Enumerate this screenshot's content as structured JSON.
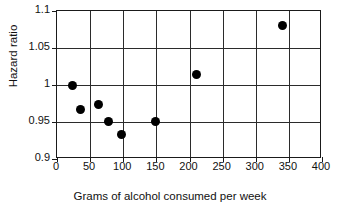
{
  "chart_data": {
    "type": "scatter",
    "title": "",
    "xlabel": "Grams of alcohol consumed per week",
    "ylabel": "Hazard ratio",
    "xlim": [
      0,
      400
    ],
    "ylim": [
      0.9,
      1.1
    ],
    "xticks": [
      0,
      50,
      100,
      150,
      200,
      250,
      300,
      350,
      400
    ],
    "xtick_labels": [
      "0",
      "50",
      "100",
      "150",
      "200",
      "250",
      "300",
      "350",
      "400"
    ],
    "yticks": [
      0.9,
      0.95,
      1,
      1.05,
      1.1
    ],
    "ytick_labels": [
      "0.9",
      "0.95",
      "1",
      "1.05",
      "1.1"
    ],
    "grid": true,
    "grid_color": "#2b2b2b",
    "legend": "none",
    "marker": "filled-circle",
    "marker_color": "#000000",
    "marker_size": 9,
    "points": [
      {
        "x": 24,
        "y": 1.0
      },
      {
        "x": 35,
        "y": 0.967
      },
      {
        "x": 63,
        "y": 0.973
      },
      {
        "x": 77,
        "y": 0.951
      },
      {
        "x": 98,
        "y": 0.933
      },
      {
        "x": 148,
        "y": 0.951
      },
      {
        "x": 211,
        "y": 1.014
      },
      {
        "x": 341,
        "y": 1.081
      }
    ]
  }
}
